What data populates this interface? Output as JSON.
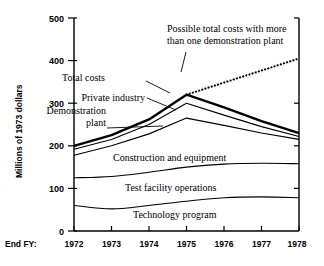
{
  "chart_data": {
    "type": "line",
    "title": "",
    "xlabel": "End FY:",
    "ylabel": "Millions of 1973 dollars",
    "x": [
      1972,
      1973,
      1974,
      1975,
      1976,
      1977,
      1978
    ],
    "xtick_labels": [
      "1972",
      "1973",
      "1974",
      "1975",
      "1976",
      "1977",
      "1978"
    ],
    "ytick_labels": [
      "0",
      "100",
      "200",
      "300",
      "400",
      "500"
    ],
    "yticks": [
      0,
      100,
      200,
      300,
      400,
      500
    ],
    "ylim": [
      0,
      500
    ],
    "xlim": [
      1972,
      1978
    ],
    "grid": false,
    "legend": "inline-annotations",
    "stacking": "cumulative-boundaries",
    "series": [
      {
        "name": "Technology program",
        "style": "solid-thin",
        "values": [
          60,
          52,
          60,
          70,
          78,
          80,
          78
        ]
      },
      {
        "name": "Test facility operations",
        "style": "solid-thin",
        "values": [
          125,
          128,
          138,
          150,
          157,
          159,
          158
        ]
      },
      {
        "name": "Construction and equipment",
        "style": "solid-thin",
        "values": [
          178,
          200,
          228,
          265,
          248,
          230,
          215
        ]
      },
      {
        "name": "Private industry",
        "style": "solid-thin",
        "values": [
          192,
          215,
          250,
          300,
          272,
          245,
          222
        ]
      },
      {
        "name": "Total costs",
        "style": "solid-bold",
        "values": [
          200,
          225,
          262,
          320,
          290,
          258,
          230
        ]
      },
      {
        "name": "Possible total costs with more than one demonstration plant",
        "style": "dotted",
        "x": [
          1975,
          1978
        ],
        "values": [
          320,
          405
        ]
      }
    ],
    "annotations": [
      {
        "text": "Possible total costs with more",
        "target": "dotted-projection"
      },
      {
        "text": "than one demonstration plant",
        "target": "dotted-projection"
      },
      {
        "text": "Total costs",
        "target": "total-costs"
      },
      {
        "text": "Private industry",
        "target": "private-industry"
      },
      {
        "text": "Demonstration",
        "target": "demonstration-plant"
      },
      {
        "text": "plant",
        "target": "demonstration-plant"
      },
      {
        "text": "Construction and equipment",
        "target": "construction-band"
      },
      {
        "text": "Test facility operations",
        "target": "test-facility-band"
      },
      {
        "text": "Technology program",
        "target": "technology-band"
      }
    ]
  },
  "axis": {
    "y_title": "Millions of 1973 dollars",
    "x_prefix": "End FY:",
    "yticks": [
      "500",
      "400",
      "300",
      "200",
      "100",
      "0"
    ],
    "xticks": [
      "1972",
      "1973",
      "1974",
      "1975",
      "1976",
      "1977",
      "1978"
    ]
  },
  "labels": {
    "projection_line1": "Possible total costs with more",
    "projection_line2": "than one demonstration plant",
    "total_costs": "Total costs",
    "private_industry": "Private industry",
    "demonstration_line1": "Demonstration",
    "demonstration_line2": "plant",
    "construction": "Construction and equipment",
    "test_facility": "Test facility operations",
    "technology": "Technology program"
  },
  "colors": {
    "background": "#ffffff",
    "ink": "#000000"
  }
}
